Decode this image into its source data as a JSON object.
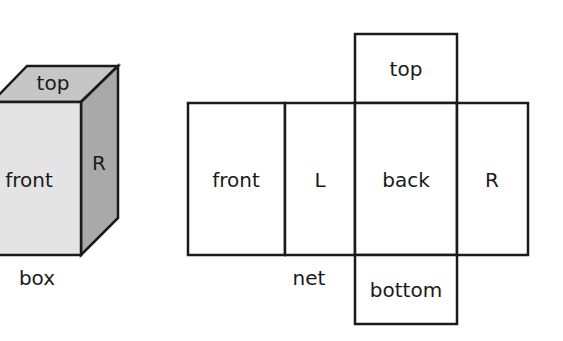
{
  "box": {
    "caption": "box",
    "faces": {
      "top": "top",
      "front": "front",
      "right": "R"
    },
    "colors": {
      "front": "#e4e4e4",
      "top": "#c6c6c6",
      "right": "#a9a9a9",
      "stroke": "#1a1a1a"
    }
  },
  "net": {
    "caption": "net",
    "faces": {
      "top": "top",
      "front": "front",
      "left": "L",
      "back": "back",
      "right": "R",
      "bottom": "bottom"
    },
    "colors": {
      "fill": "#ffffff",
      "stroke": "#1a1a1a"
    }
  }
}
